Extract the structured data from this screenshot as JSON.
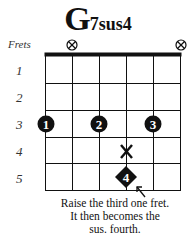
{
  "chord": {
    "root": "G",
    "suffix": "7sus4",
    "full_name": "G7sus4"
  },
  "frets_label": "Frets",
  "fret_numbers": [
    "1",
    "2",
    "3",
    "4",
    "5"
  ],
  "muted_strings": [
    1,
    6
  ],
  "open_string_marker": "mute-x-circle",
  "fingers": [
    {
      "string": 1,
      "fret": 3,
      "label": "1",
      "shape": "circle"
    },
    {
      "string": 3,
      "fret": 3,
      "label": "2",
      "shape": "circle"
    },
    {
      "string": 5,
      "fret": 3,
      "label": "3",
      "shape": "circle"
    },
    {
      "string": 4,
      "fret": 5,
      "label": "4",
      "shape": "diamond"
    }
  ],
  "removed_note": {
    "string": 4,
    "fret": 4,
    "marker": "X"
  },
  "caption": {
    "line1": "Raise the third one fret.",
    "line2": "It then becomes the",
    "line3": "sus. fourth."
  },
  "colors": {
    "ink": "#111111",
    "background": "#ffffff"
  }
}
